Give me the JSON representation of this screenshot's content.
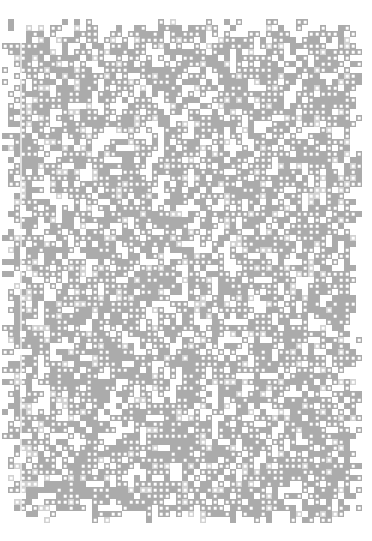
{
  "image": {
    "kind": "pattern-texture",
    "description": "Dense pseudo-random dot-matrix noise texture on white paper",
    "width": 372,
    "height": 541,
    "background_color": "#ffffff",
    "has_text": false,
    "has_ui_controls": false
  },
  "pattern": {
    "name": "dot-matrix-noise",
    "cell_size": 6,
    "dot_size": 2.6,
    "origin_x": 2,
    "origin_y": 19,
    "block_width": 356,
    "block_height": 499,
    "columns": 60,
    "rows": 84,
    "module_color": "#ababab",
    "module_light_color": "#d2d2d2",
    "dot_color": "#ffffff",
    "fill_density": 0.74,
    "dot_probability": 0.52,
    "light_probability": 0.1,
    "edge_raggedness": 2,
    "seed": 20240517
  },
  "margins": {
    "top": 19,
    "right": 14,
    "bottom": 23,
    "left": 2
  },
  "artifacts": {
    "scan_streak": {
      "name": "vertical-fold-line",
      "x": 20,
      "width": 1.5,
      "color": "rgba(255,255,255,0.62)"
    }
  }
}
